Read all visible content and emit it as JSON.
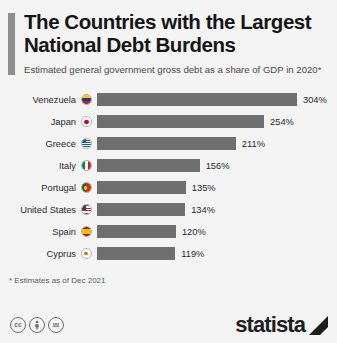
{
  "header": {
    "title": "The Countries with the Largest National Debt Burdens",
    "subtitle": "Estimated general government gross debt as a share of GDP in 2020*"
  },
  "footnote": "* Estimates as of Dec 2021",
  "footer": {
    "cc_badges": [
      {
        "name": "cc-icon",
        "label": "cc"
      },
      {
        "name": "cc-by-icon",
        "label": "by"
      },
      {
        "name": "cc-nd-icon",
        "label": "nd"
      }
    ],
    "brand": "statista"
  },
  "colors": {
    "bar": "#6f6f6f",
    "accent": "#8e8e8e",
    "background": "#f4f4f4",
    "text": "#161616"
  },
  "chart_data": {
    "type": "bar",
    "orientation": "horizontal",
    "title": "The Countries with the Largest National Debt Burdens",
    "subtitle": "Estimated general government gross debt as a share of GDP in 2020*",
    "xlabel": "",
    "ylabel": "",
    "xlim": [
      0,
      304
    ],
    "grid": false,
    "legend": false,
    "unit": "%",
    "categories": [
      "Venezuela",
      "Japan",
      "Greece",
      "Italy",
      "Portugal",
      "United States",
      "Spain",
      "Cyprus"
    ],
    "values": [
      304,
      254,
      211,
      156,
      135,
      134,
      120,
      119
    ],
    "labels": [
      "304%",
      "254%",
      "211%",
      "156%",
      "135%",
      "134%",
      "120%",
      "119%"
    ]
  }
}
